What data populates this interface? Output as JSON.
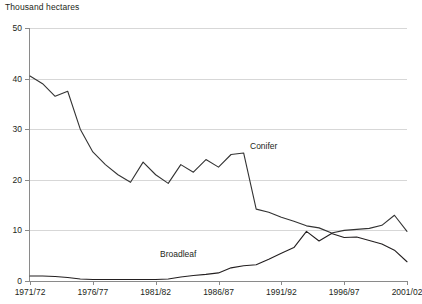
{
  "chart_data": {
    "type": "line",
    "title": "Thousand hectares",
    "xlabel": "",
    "ylabel": "Thousand hectares",
    "ylim": [
      0,
      50
    ],
    "yticks": [
      0,
      10,
      20,
      30,
      40,
      50
    ],
    "ytick_labels": [
      "0",
      "10",
      "20",
      "30",
      "40",
      "50"
    ],
    "grid": true,
    "legend_position": "inline-labels",
    "x": [
      "1971/72",
      "1972/73",
      "1973/74",
      "1974/75",
      "1975/76",
      "1976/77",
      "1977/78",
      "1978/79",
      "1979/80",
      "1980/81",
      "1981/82",
      "1982/83",
      "1983/84",
      "1984/85",
      "1985/86",
      "1986/87",
      "1987/88",
      "1988/89",
      "1989/90",
      "1990/91",
      "1991/92",
      "1992/93",
      "1993/94",
      "1994/95",
      "1995/96",
      "1996/97",
      "1997/98",
      "1998/99",
      "1999/00",
      "2000/01",
      "2001/02"
    ],
    "xtick_labels": [
      "1971/72",
      "1976/77",
      "1981/82",
      "1986/87",
      "1991/92",
      "1996/97",
      "2001/02"
    ],
    "xtick_indices": [
      0,
      5,
      10,
      15,
      20,
      25,
      30
    ],
    "series": [
      {
        "name": "Conifer",
        "label": "Conifer",
        "color": "#333333",
        "values": [
          40.5,
          39.0,
          36.5,
          37.5,
          30.0,
          25.5,
          23.0,
          21.0,
          19.5,
          23.5,
          21.0,
          19.3,
          23.0,
          21.5,
          24.0,
          22.5,
          25.0,
          25.3,
          14.2,
          13.6,
          12.6,
          11.8,
          10.9,
          10.5,
          9.5,
          10.0,
          10.2,
          10.4,
          11.0,
          13.0,
          9.8
        ]
      },
      {
        "name": "Broadleaf",
        "label": "Broadleaf",
        "color": "#231f20",
        "values": [
          1.0,
          1.0,
          0.9,
          0.7,
          0.4,
          0.3,
          0.3,
          0.3,
          0.3,
          0.3,
          0.3,
          0.4,
          0.8,
          1.1,
          1.3,
          1.6,
          2.6,
          3.0,
          3.2,
          4.3,
          5.5,
          6.6,
          9.8,
          7.9,
          9.4,
          8.6,
          8.7,
          8.0,
          7.3,
          6.1,
          3.8
        ]
      }
    ],
    "annotations": [
      {
        "text": "Conifer",
        "series": "Conifer"
      },
      {
        "text": "Broadleaf",
        "series": "Broadleaf"
      }
    ],
    "footnote": ""
  }
}
